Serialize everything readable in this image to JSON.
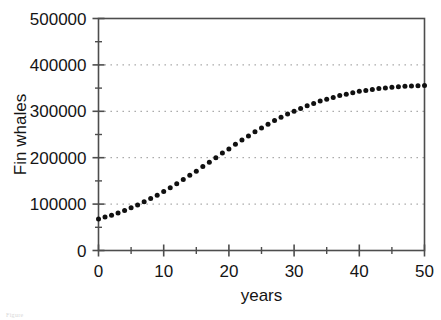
{
  "figure": {
    "background_color": "#ffffff",
    "axis_color": "#4d4d4d",
    "marker_color": "#101010",
    "grid_color": "#8a8a8a",
    "caption_fragment": "Figure"
  },
  "chart_data": {
    "type": "scatter",
    "title": "",
    "xlabel": "years",
    "ylabel": "Fin whales",
    "xlim": [
      0,
      50
    ],
    "ylim": [
      0,
      500000
    ],
    "grid": true,
    "grid_axis": "y",
    "grid_style": "dotted",
    "legend": "none",
    "marker": "filled-circle",
    "marker_size_px": 5,
    "xticks": [
      0,
      10,
      20,
      30,
      40,
      50
    ],
    "xtick_labels": [
      "0",
      "10",
      "20",
      "30",
      "40",
      "50"
    ],
    "x_minor_ticks": [
      5,
      15,
      25,
      35,
      45
    ],
    "yticks": [
      0,
      100000,
      200000,
      300000,
      400000,
      500000
    ],
    "ytick_labels": [
      "0",
      "100000",
      "200000",
      "300000",
      "400000",
      "500000"
    ],
    "y_minor_ticks": [
      50000,
      150000,
      250000,
      350000,
      450000
    ],
    "gridlines_y": [
      100000,
      200000,
      300000,
      400000
    ],
    "x": [
      0,
      1,
      2,
      3,
      4,
      5,
      6,
      7,
      8,
      9,
      10,
      11,
      12,
      13,
      14,
      15,
      16,
      17,
      18,
      19,
      20,
      21,
      22,
      23,
      24,
      25,
      26,
      27,
      28,
      29,
      30,
      31,
      32,
      33,
      34,
      35,
      36,
      37,
      38,
      39,
      40,
      41,
      42,
      43,
      44,
      45,
      46,
      47,
      48,
      49,
      50
    ],
    "y": [
      68000,
      72000,
      76000,
      81000,
      86000,
      92000,
      98000,
      105000,
      112000,
      119000,
      127000,
      135000,
      144000,
      153000,
      162000,
      171000,
      181000,
      190000,
      200000,
      210000,
      219000,
      229000,
      238000,
      247000,
      256000,
      264000,
      272000,
      280000,
      287000,
      294000,
      300000,
      306000,
      312000,
      317000,
      322000,
      326000,
      330000,
      334000,
      337000,
      340000,
      343000,
      345000,
      347000,
      349000,
      350000,
      352000,
      353000,
      354000,
      354500,
      355000,
      355500
    ]
  }
}
